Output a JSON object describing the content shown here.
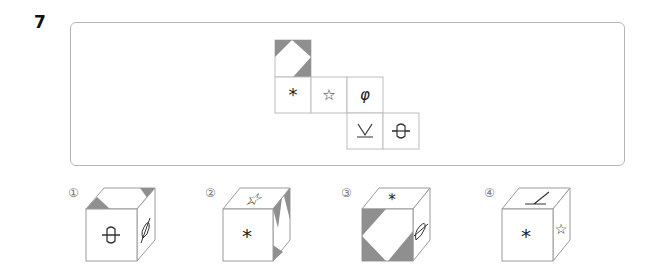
{
  "question": {
    "number": "7"
  },
  "net": {
    "faces": [
      {
        "id": "top",
        "symbol": "",
        "pattern": "diamond-shaded-corners"
      },
      {
        "id": "r1c1",
        "symbol": "*"
      },
      {
        "id": "r1c2",
        "symbol": "☆"
      },
      {
        "id": "r1c3",
        "symbol": "φ"
      },
      {
        "id": "r2c3",
        "symbol": "⊻"
      },
      {
        "id": "r2c4",
        "symbol": "-O-"
      }
    ]
  },
  "options": [
    {
      "label": "①",
      "front": "-O-",
      "top": "diamond-shaded-corners",
      "side": "φ"
    },
    {
      "label": "②",
      "front": "*",
      "top": "☆",
      "side": "diamond-shaded-corners"
    },
    {
      "label": "③",
      "front": "diamond-shaded-corners",
      "top": "*",
      "side": "-O-"
    },
    {
      "label": "④",
      "front": "*",
      "top": "⊻",
      "side": "☆"
    }
  ],
  "colors": {
    "shade": "#8f8f8f",
    "line": "#bdbdbd"
  }
}
